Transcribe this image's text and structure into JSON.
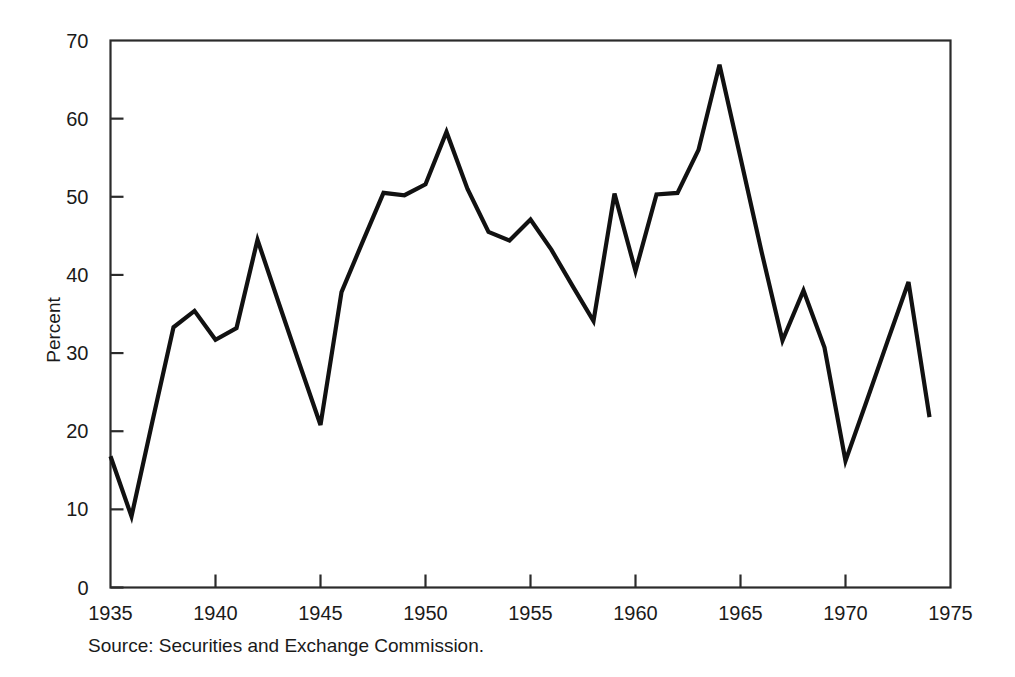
{
  "figure": {
    "background_color": "#ffffff",
    "source_note": "Source: Securities and Exchange Commission."
  },
  "chart_data": {
    "type": "line",
    "title": "",
    "xlabel": "",
    "ylabel": "Percent",
    "xlim": [
      1935,
      1975
    ],
    "ylim": [
      0,
      70
    ],
    "xticks": [
      1935,
      1940,
      1945,
      1950,
      1955,
      1960,
      1965,
      1970,
      1975
    ],
    "xtick_labels": [
      "1935",
      "1940",
      "1945",
      "1950",
      "1955",
      "1960",
      "1965",
      "1970",
      "1975"
    ],
    "yticks": [
      0,
      10,
      20,
      30,
      40,
      50,
      60,
      70
    ],
    "ytick_labels": [
      "0",
      "10",
      "20",
      "30",
      "40",
      "50",
      "60",
      "70"
    ],
    "grid": false,
    "legend": null,
    "line_color": "#111111",
    "x": [
      1935,
      1936,
      1937,
      1938,
      1939,
      1940,
      1941,
      1942,
      1943,
      1944,
      1945,
      1946,
      1947,
      1948,
      1949,
      1950,
      1951,
      1952,
      1953,
      1954,
      1955,
      1956,
      1957,
      1958,
      1959,
      1960,
      1961,
      1962,
      1963,
      1964,
      1965,
      1966,
      1967,
      1968,
      1969,
      1970,
      1971,
      1972,
      1973,
      1974
    ],
    "values": [
      16.8,
      9.1,
      21.3,
      33.3,
      35.4,
      31.7,
      33.2,
      44.5,
      36.5,
      28.6,
      20.8,
      37.8,
      44.2,
      50.5,
      50.2,
      51.6,
      58.3,
      51.0,
      45.5,
      44.4,
      47.1,
      43.2,
      38.6,
      34.1,
      50.4,
      40.5,
      50.3,
      50.5,
      56.0,
      66.9,
      55.0,
      43.0,
      31.6,
      38.0,
      30.7,
      16.2,
      23.8,
      31.5,
      39.1,
      21.8
    ]
  }
}
